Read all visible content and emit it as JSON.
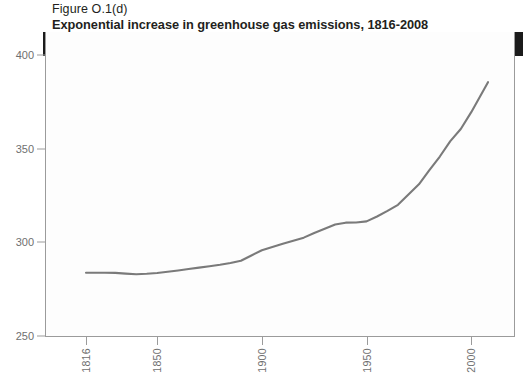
{
  "figure": {
    "caption": "Figure O.1(d)",
    "title": "Exponential increase in greenhouse gas emissions, 1816-2008",
    "banner_label": "Atmospheric carbon dioxide concentration: parts per million"
  },
  "chart_data": {
    "type": "line",
    "title": "Exponential increase in greenhouse gas emissions, 1816-2008",
    "subtitle": "Atmospheric carbon dioxide concentration: parts per million",
    "xlabel": "",
    "ylabel": "Atmospheric carbon dioxide concentration: parts per million",
    "xlim": [
      1816,
      2008
    ],
    "ylim": [
      250,
      400
    ],
    "grid": false,
    "legend": "none",
    "line_color": "#7a7a7a",
    "xticks": [
      1816,
      1850,
      1900,
      1950,
      2000
    ],
    "xtick_labels": [
      "1816",
      "1850",
      "1900",
      "1950",
      "2000"
    ],
    "yticks": [
      250,
      300,
      350,
      400
    ],
    "ytick_labels": [
      "250",
      "300",
      "350",
      "400"
    ],
    "series": [
      {
        "name": "Atmospheric CO2 concentration (ppm)",
        "x": [
          1816,
          1820,
          1825,
          1830,
          1835,
          1840,
          1845,
          1850,
          1855,
          1860,
          1865,
          1870,
          1875,
          1880,
          1885,
          1890,
          1895,
          1900,
          1905,
          1910,
          1915,
          1920,
          1925,
          1930,
          1935,
          1940,
          1945,
          1950,
          1955,
          1960,
          1965,
          1970,
          1975,
          1980,
          1985,
          1990,
          1995,
          2000,
          2005,
          2008
        ],
        "values": [
          283.8,
          283.8,
          283.8,
          283.7,
          283.3,
          283.0,
          283.2,
          283.6,
          284.3,
          285.0,
          285.8,
          286.5,
          287.2,
          288.0,
          289.0,
          290.2,
          293.0,
          295.8,
          297.5,
          299.2,
          300.8,
          302.5,
          305.0,
          307.2,
          309.5,
          310.5,
          310.6,
          311.2,
          313.8,
          316.8,
          320.0,
          325.5,
          331.0,
          338.5,
          345.8,
          354.0,
          360.5,
          369.5,
          379.5,
          385.5
        ]
      }
    ]
  }
}
